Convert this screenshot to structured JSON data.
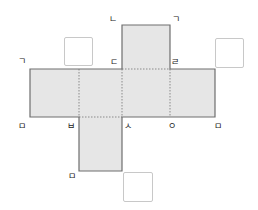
{
  "diagram": {
    "type": "cube-net",
    "colors": {
      "fill": "#e6e6e6",
      "outline": "#6e6e6e",
      "fold_line": "#8a8a8a",
      "label": "#222222",
      "answer_box_border": "#c8c8c8"
    },
    "faces": [
      {
        "id": "top",
        "x": 122,
        "y": 25,
        "w": 48,
        "h": 44
      },
      {
        "id": "row-1",
        "x": 30,
        "y": 69,
        "w": 49,
        "h": 48
      },
      {
        "id": "row-2",
        "x": 79,
        "y": 69,
        "w": 43,
        "h": 48
      },
      {
        "id": "row-3",
        "x": 122,
        "y": 69,
        "w": 48,
        "h": 48
      },
      {
        "id": "row-4",
        "x": 170,
        "y": 69,
        "w": 45,
        "h": 48
      },
      {
        "id": "bottom",
        "x": 79,
        "y": 117,
        "w": 43,
        "h": 54
      }
    ],
    "vertex_labels": [
      {
        "id": "label-giyeok-top",
        "text": "ㄱ",
        "x": 172,
        "y": 15
      },
      {
        "id": "label-nieun",
        "text": "ㄴ",
        "x": 109,
        "y": 15
      },
      {
        "id": "label-digeut",
        "text": "ㄷ",
        "x": 110,
        "y": 58
      },
      {
        "id": "label-rieul",
        "text": "ㄹ",
        "x": 171,
        "y": 58
      },
      {
        "id": "label-giyeok-left",
        "text": "ㄱ",
        "x": 18,
        "y": 57
      },
      {
        "id": "label-mieum-left",
        "text": "ㅁ",
        "x": 18,
        "y": 122
      },
      {
        "id": "label-bieup",
        "text": "ㅂ",
        "x": 67,
        "y": 122
      },
      {
        "id": "label-siot",
        "text": "ㅅ",
        "x": 124,
        "y": 122
      },
      {
        "id": "label-ieung",
        "text": "ㅇ",
        "x": 168,
        "y": 122
      },
      {
        "id": "label-mieum-right",
        "text": "ㅁ",
        "x": 214,
        "y": 122
      },
      {
        "id": "label-mieum-bottom",
        "text": "ㅁ",
        "x": 68,
        "y": 172
      }
    ],
    "answer_boxes": [
      {
        "id": "answer-box-1",
        "x": 64,
        "y": 37,
        "w": 29,
        "h": 29,
        "value": ""
      },
      {
        "id": "answer-box-2",
        "x": 215,
        "y": 38,
        "w": 29,
        "h": 30,
        "value": ""
      },
      {
        "id": "answer-box-3",
        "x": 123,
        "y": 172,
        "w": 30,
        "h": 30,
        "value": ""
      }
    ]
  }
}
